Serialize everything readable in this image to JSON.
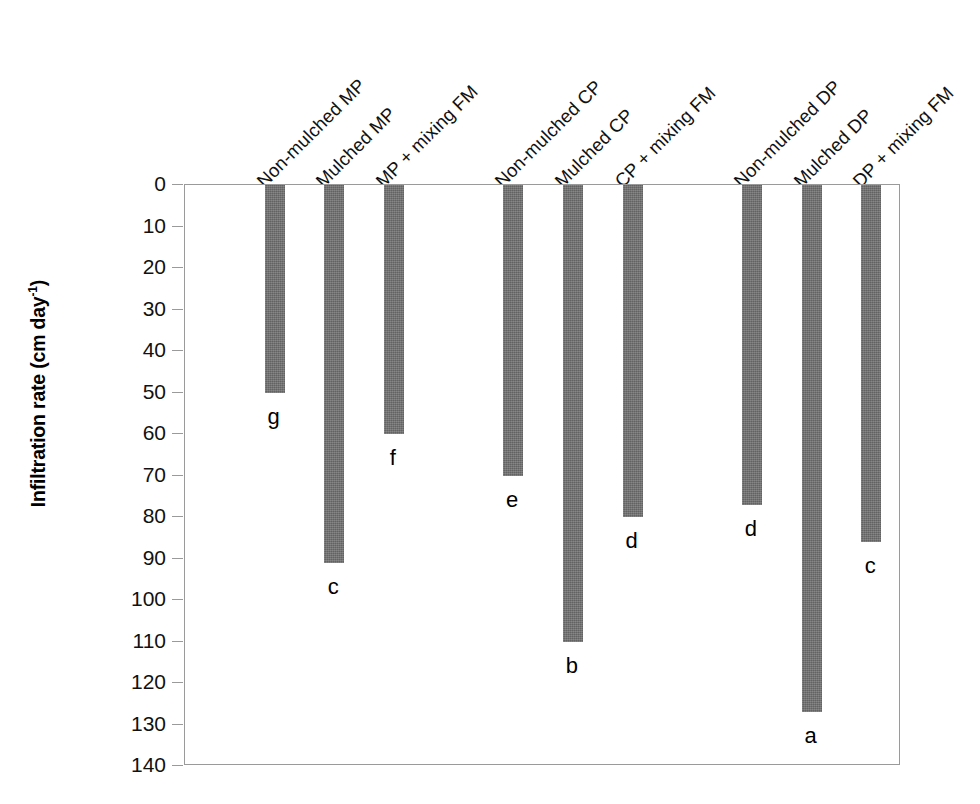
{
  "chart_data": {
    "type": "bar",
    "title": "",
    "xlabel": "",
    "ylabel": "Infiltration rate (cm day",
    "ylabel_exponent": "-1",
    "ylabel_suffix": ")",
    "orientation": "vertical-inverted",
    "ylim": [
      0,
      140
    ],
    "y_inverted": true,
    "grid": false,
    "legend": "none",
    "bar_color": "#6e6e6e",
    "yticks": [
      0,
      10,
      20,
      30,
      40,
      50,
      60,
      70,
      80,
      90,
      100,
      110,
      120,
      130,
      140
    ],
    "ytick_labels": [
      "0",
      "10",
      "20",
      "30",
      "40",
      "50",
      "60",
      "70",
      "80",
      "90",
      "100",
      "110",
      "120",
      "130",
      "140"
    ],
    "categories": [
      "Non-mulched MP",
      "Mulched MP",
      "MP + mixing FM",
      "Non-mulched CP",
      "Mulched CP",
      "CP + mixing FM",
      "Non-mulched DP",
      "Mulched DP",
      "DP + mixing FM"
    ],
    "values": [
      50,
      91,
      60,
      70,
      110,
      80,
      77,
      127,
      86
    ],
    "annotations": [
      "g",
      "c",
      "f",
      "e",
      "b",
      "d",
      "d",
      "a",
      "c"
    ],
    "bar_slots": [
      1,
      2,
      3,
      5,
      6,
      7,
      9,
      10,
      11
    ],
    "slot_count": 12
  }
}
